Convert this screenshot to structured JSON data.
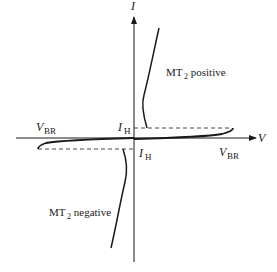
{
  "diagram": {
    "axes": {
      "y_label": "I",
      "x_label": "V"
    },
    "labels": {
      "holding_current_upper": {
        "main": "I",
        "sub": "H"
      },
      "holding_current_lower": {
        "main": "I",
        "sub": "H"
      },
      "breakover_left": {
        "main": "V",
        "sub": "BR"
      },
      "breakover_right": {
        "main": "V",
        "sub": "BR"
      },
      "quadrant_1": {
        "main": "MT",
        "sub": "2",
        "rest": " positive"
      },
      "quadrant_3": {
        "main": "MT",
        "sub": "2",
        "rest": " negative"
      }
    },
    "colors": {
      "line": "#1a1a1a",
      "background": "#ffffff"
    }
  }
}
